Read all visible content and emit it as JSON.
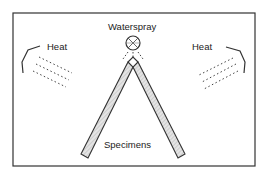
{
  "diagram": {
    "labels": {
      "waterspray": "Waterspray",
      "heat_left": "Heat",
      "heat_right": "Heat",
      "specimens": "Specimens"
    },
    "components": [
      {
        "name": "waterspray-nozzle",
        "icon": "circle-cross"
      },
      {
        "name": "heat-lamp-left",
        "icon": "bent-reflector"
      },
      {
        "name": "heat-lamp-right",
        "icon": "bent-reflector"
      },
      {
        "name": "specimen-left",
        "icon": "hatched-bar"
      },
      {
        "name": "specimen-right",
        "icon": "hatched-bar"
      }
    ],
    "colors": {
      "stroke": "#333333",
      "fill": "#dddddd",
      "background": "#ffffff"
    }
  }
}
